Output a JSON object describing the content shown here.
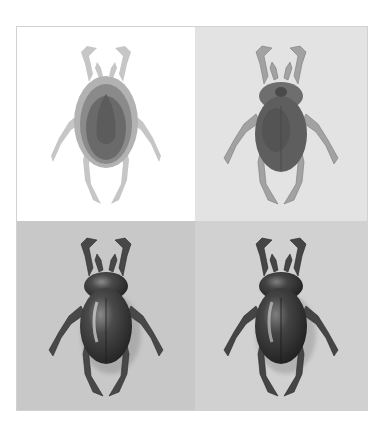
{
  "figure": {
    "panels": [
      {
        "id": "stage-1",
        "stage": "silhouette-tonal-mask",
        "background": "#ffffff",
        "body_color": "#6a6a6a",
        "leg_color": "#c4c4c4"
      },
      {
        "id": "stage-2",
        "stage": "flat-shaded",
        "background": "#e3e3e3",
        "body_color": "#5e5e5e",
        "leg_color": "#9a9a9a"
      },
      {
        "id": "stage-3",
        "stage": "fully-rendered-glossy",
        "background": "#c8c8c8",
        "body_color": "#3a3a3a",
        "leg_color": "#4a4a4a"
      },
      {
        "id": "stage-4",
        "stage": "fully-rendered-final",
        "background": "#d1d1d1",
        "body_color": "#353535",
        "leg_color": "#474747"
      }
    ],
    "border_color": "#d2d2d2"
  }
}
